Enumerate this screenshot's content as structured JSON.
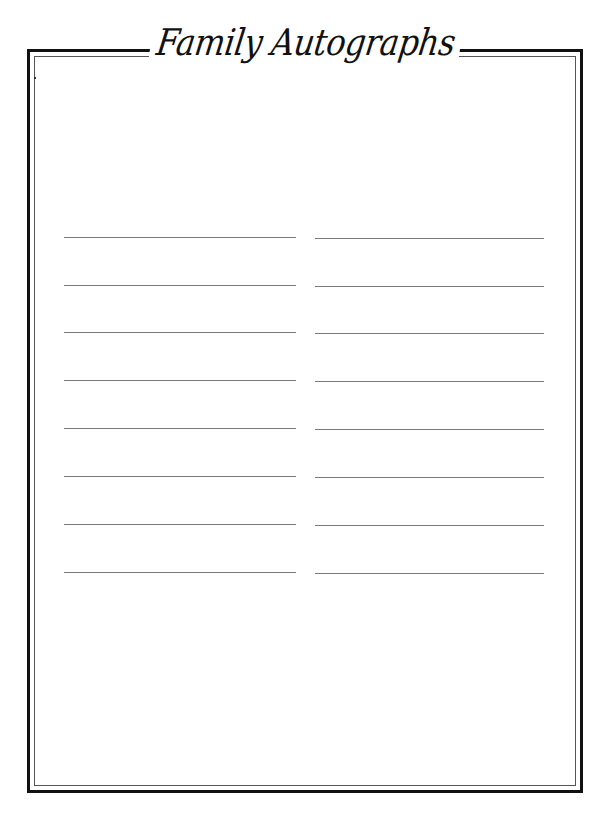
{
  "page": {
    "title": "Family Autographs",
    "frame": {
      "outer_border_color": "#111111",
      "inner_border_color": "#555555"
    },
    "signature_lines": {
      "color": "#7a7a7a",
      "columns": [
        {
          "x_start": 64,
          "x_end": 296,
          "rows_y": [
            237,
            285,
            332,
            380,
            428,
            476,
            524,
            572
          ]
        },
        {
          "x_start": 315,
          "x_end": 544,
          "rows_y": [
            238,
            286,
            333,
            381,
            429,
            477,
            525,
            573
          ]
        }
      ]
    }
  }
}
